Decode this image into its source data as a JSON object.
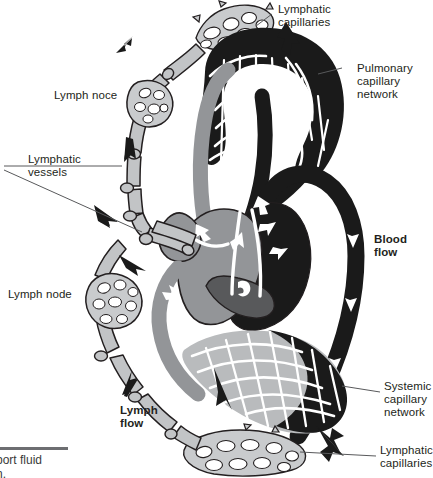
{
  "figure": {
    "caption_line1": "port fluid",
    "caption_line2": "n."
  },
  "labels": {
    "lymphatic_capillaries_top": "Lymphatic\ncapillaries",
    "pulmonary_capillary_network": "Pulmonary\ncapillary\nnetwork",
    "lymph_noce": "Lymph noce",
    "lymphatic_vessels": "Lymphatic\nvessels",
    "blood_flow": "Blood\nflow",
    "lymph_node": "Lymph node",
    "systemic_capillary_network": "Systemic\ncapillary\nnetwork",
    "lymph_flow": "Lymph\nflow",
    "lymphatic_capillaries_bottom": "Lymphatic\ncapillaries"
  },
  "colors": {
    "deoxygenated_gray": "#939598",
    "oxygenated_black": "#1a1a1a",
    "lymph_gray": "#b3b5b8",
    "outline": "#231f20",
    "text": "#231f20",
    "caption_text": "#3a3a3a",
    "leader_line": "#58595b",
    "background": "#ffffff"
  },
  "structures": {
    "heart": "heart-cross-section",
    "pulmonary_network": "pulmonary-capillary-network",
    "systemic_network": "systemic-capillary-network",
    "lymph_nodes_count": 3,
    "lymphatic_capillary_beds": 2
  },
  "flow_arrows": {
    "blood": "white arrows inside heart chambers and vessels",
    "lymph": "black arrows along lymphatic vessels"
  }
}
